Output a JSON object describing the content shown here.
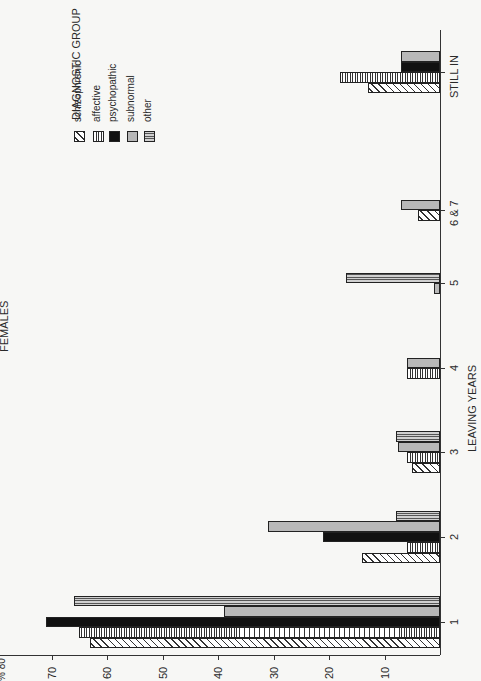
{
  "chart_data": {
    "type": "bar",
    "orientation": "rotated 90deg (bars extend leftward from baseline at right; text reads bottom-to-top)",
    "title": "FEMALES",
    "xlabel": "LEAVING YEARS",
    "ylabel": "%",
    "ylim": [
      0,
      80
    ],
    "y_ticks": [
      10,
      20,
      30,
      40,
      50,
      60,
      70,
      80
    ],
    "categories": [
      "1",
      "2",
      "3",
      "4",
      "5",
      "6 & 7",
      "STILL IN"
    ],
    "legend_title": "DIAGNOSTIC GROUP",
    "series": [
      {
        "name": "schizophrenic",
        "values": [
          63,
          14,
          5,
          0,
          0,
          4,
          13
        ]
      },
      {
        "name": "affective",
        "values": [
          65,
          6,
          6,
          6,
          0,
          0,
          18
        ]
      },
      {
        "name": "psychopathic",
        "values": [
          71,
          21,
          0,
          0,
          0,
          0,
          7
        ]
      },
      {
        "name": "subnormal",
        "values": [
          39,
          31,
          7.5,
          6,
          1,
          7,
          7
        ]
      },
      {
        "name": "other",
        "values": [
          66,
          8,
          8,
          0,
          17,
          0,
          0
        ]
      }
    ]
  },
  "labels": {
    "title": "FEMALES",
    "xlabel": "LEAVING YEARS",
    "ylabel_top": "% 80",
    "legend_title": "DIAGNOSTIC GROUP",
    "legend": [
      "schizophrenic",
      "affective",
      "psychopathic",
      "subnormal",
      "other"
    ],
    "ticks": [
      "70",
      "60",
      "50",
      "40",
      "30",
      "20",
      "10"
    ],
    "categories": [
      "1",
      "2",
      "3",
      "4",
      "5",
      "6 & 7",
      "STILL IN"
    ]
  }
}
